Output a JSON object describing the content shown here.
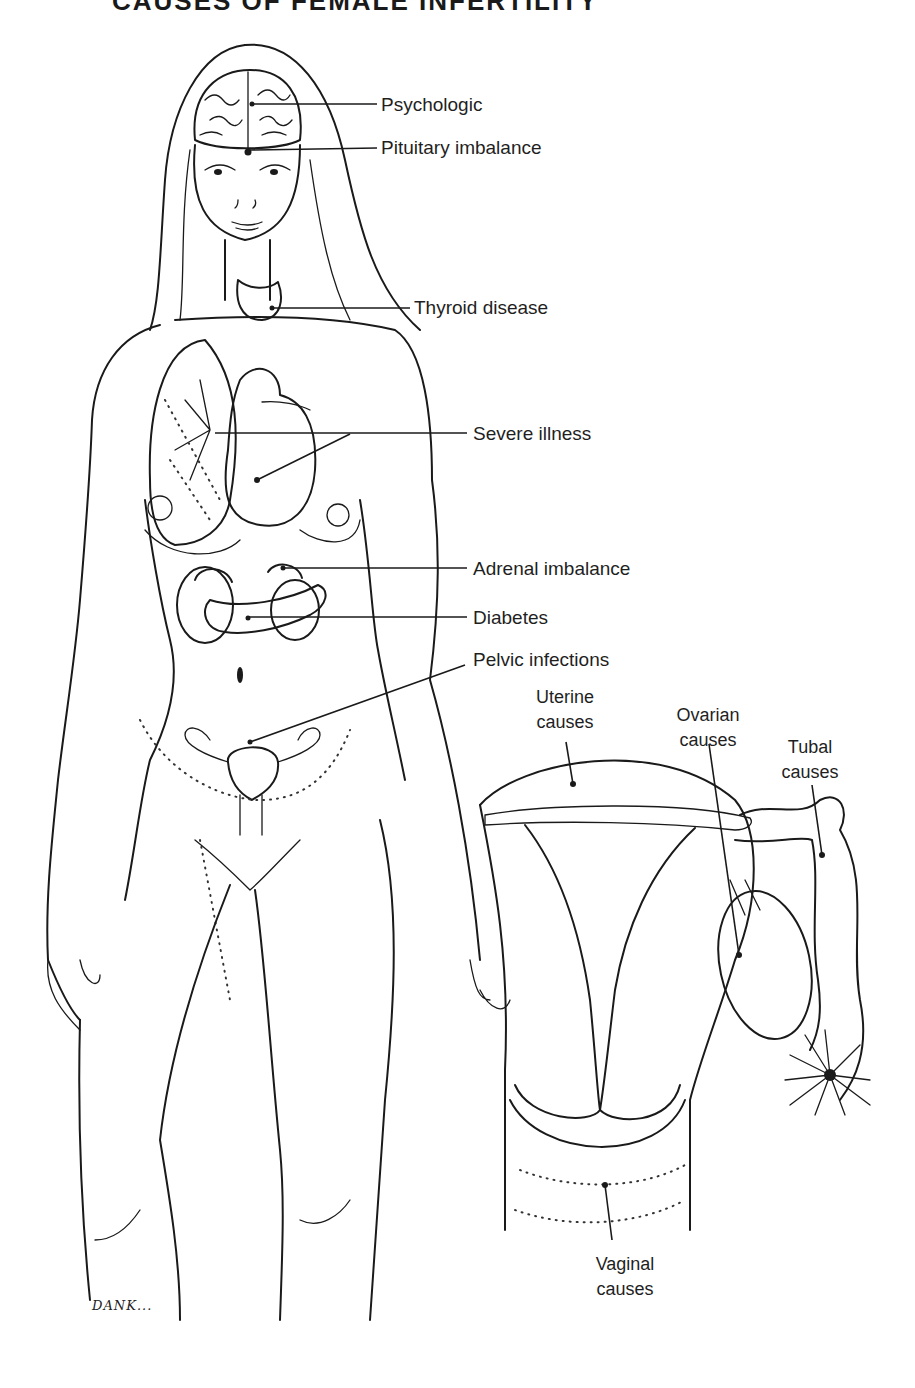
{
  "title": "CAUSES OF FEMALE INFERTILITY",
  "figure": {
    "artist_signature": "DANK..."
  },
  "labels": {
    "psychologic": "Psychologic",
    "pituitary": "Pituitary imbalance",
    "thyroid": "Thyroid disease",
    "severe_illness": "Severe illness",
    "adrenal": "Adrenal imbalance",
    "diabetes": "Diabetes",
    "pelvic": "Pelvic infections"
  },
  "inset_labels": {
    "uterine": [
      "Uterine",
      "causes"
    ],
    "ovarian": [
      "Ovarian",
      "causes"
    ],
    "tubal": [
      "Tubal",
      "causes"
    ],
    "vaginal": [
      "Vaginal",
      "causes"
    ]
  },
  "colors": {
    "ink": "#1a1a1a",
    "background": "#ffffff"
  }
}
